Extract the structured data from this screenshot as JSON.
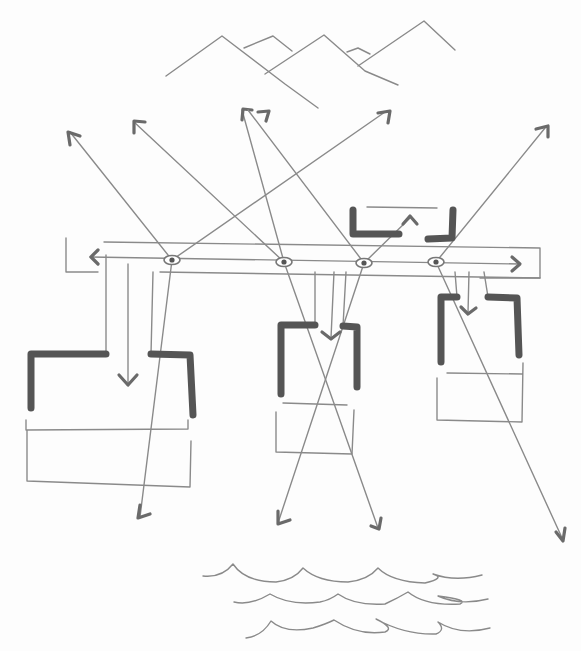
{
  "title": "Hand-drawn architectural concept sketch: viewpoints, sightlines, pavilions, mountains and water",
  "colors": {
    "paper": "#fdfdfd",
    "thin_line": "#8a8a8a",
    "thick_wall": "#555555",
    "arrow_head": "#6a6a6a"
  },
  "mountains": [
    "M166,76 L222,36 L285,84 L318,108",
    "M244,48 L273,36 L292,51",
    "M265,74 L324,35 L365,71 L398,85",
    "M347,52 L358,48 L370,54",
    "M358,66 L424,21 L455,50"
  ],
  "circulation": {
    "outline_top": "M66,238 L66,272 L98,272 M104,242 L540,248 L540,278 L480,278",
    "spine": "M90,257 L520,264",
    "left_arrow": "M98,250 L91,257 L98,264",
    "right_arrow": "M512,257 L520,264 L512,271",
    "lower_edge": "M160,272 L540,278"
  },
  "eyes": [
    {
      "cx": 172,
      "cy": 260
    },
    {
      "cx": 284,
      "cy": 262
    },
    {
      "cx": 364,
      "cy": 263
    },
    {
      "cx": 436,
      "cy": 262
    }
  ],
  "sightlines": [
    {
      "path": "M172,260 L70,132",
      "head": "M70,145 L68,132 L80,136"
    },
    {
      "path": "M172,260 L385,112",
      "head": "M378,113 L390,111 L388,123"
    },
    {
      "path": "M172,260 L140,517",
      "head": "M140,505 L138,518 L150,514"
    },
    {
      "path": "M284,262 L134,122",
      "head": "M134,133 L134,121 L145,122"
    },
    {
      "path": "M284,262 L242,110",
      "head": "M242,120 L243,109 L252,110"
    },
    {
      "path": "M284,262 L378,528",
      "head": "M371,526 L379,529 L381,518"
    },
    {
      "path": "M364,263 L248,110",
      "head": "M258,112 L269,111 L266,121"
    },
    {
      "path": "M364,263 L278,523",
      "head": "M278,511 L278,524 L290,520"
    },
    {
      "path": "M436,262 L545,128",
      "head": "M536,129 L548,126 L548,137"
    },
    {
      "path": "M436,262 L563,540",
      "head": "M556,532 L563,541 L565,528"
    },
    {
      "path": "M364,263 L410,218",
      "head": "M403,224 L410,216 L417,224"
    }
  ],
  "pavilions": [
    {
      "name": "left",
      "walls": [
        "M31,408 L31,354 L106,354",
        "M151,354 L190,355 L193,415"
      ],
      "connectors": [
        "M106,354 L106,255",
        "M151,354 L153,272"
      ],
      "entry_arrow": {
        "line": "M128,264 L128,385",
        "head": "M119,375 L128,385 L137,375"
      },
      "base": "M26,420 L26,430 L188,429 L188,420 M27,430 L27,481 L190,487 L191,441"
    },
    {
      "name": "center",
      "walls": [
        "M281,394 L281,325 L315,325",
        "M343,326 L357,327 L357,387"
      ],
      "connectors": [
        "M315,325 L315,272",
        "M343,326 L346,272"
      ],
      "entry_arrow": {
        "line": "M334,272 L331,338",
        "head": "M322,332 L331,339 L340,332"
      },
      "base": "M283,403 L347,405 M276,412 L276,452 L352,454 L354,410"
    },
    {
      "name": "right",
      "walls": [
        "M441,362 L441,297 L457,297",
        "M488,297 L517,298 L519,355"
      ],
      "connectors": [
        "M457,297 L455,272",
        "M488,297 L484,272"
      ],
      "entry_arrow": {
        "line": "M469,272 L468,313",
        "head": "M461,307 L468,314 L476,308"
      },
      "base": "M447,373 L522,374 M437,378 L437,420 L522,422 L523,363"
    },
    {
      "name": "top",
      "walls": [
        "M353,210 L353,234 L399,234",
        "M453,210 L452,238 L428,239"
      ],
      "connectors": [],
      "entry_arrow": null,
      "base": "M367,207 L437,208"
    }
  ],
  "waves": [
    "M203,576 Q222,578 233,564 Q245,582 276,582 Q294,580 303,568 Q318,582 348,582 Q368,580 378,568 Q392,582 425,583 Q446,578 433,574 Q455,582 482,575",
    "M234,602 Q250,606 270,594 Q290,606 320,602 Q330,600 338,594 Q355,606 385,604 Q398,598 408,592 Q425,606 460,604 Q470,600 438,596 Q460,606 488,599",
    "M246,638 Q262,636 271,621 Q285,634 313,628 Q326,624 334,620 Q358,636 385,632 Q395,628 376,619 Q405,635 436,634 Q446,630 438,622 Q460,636 490,628"
  ]
}
